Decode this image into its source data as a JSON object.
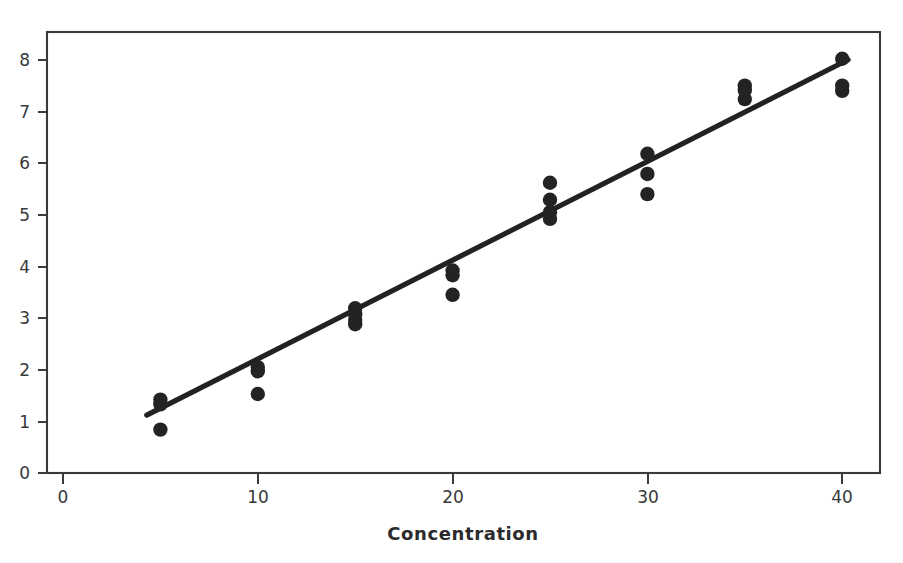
{
  "chart_data": {
    "type": "scatter",
    "title": "",
    "subtitle": "",
    "xlabel": "Concentration",
    "ylabel": "",
    "xlim": [
      0,
      42
    ],
    "ylim": [
      0,
      8.4
    ],
    "xticks": [
      0,
      10,
      20,
      30,
      40
    ],
    "yticks": [
      0,
      1,
      2,
      3,
      4,
      5,
      6,
      7,
      8
    ],
    "xticklabels": [
      "0",
      "10",
      "20",
      "30",
      "40"
    ],
    "yticklabels": [
      "0",
      "1",
      "2",
      "3",
      "4",
      "5",
      "6",
      "7",
      "8"
    ],
    "grid": false,
    "legend": null,
    "legend_position": "none",
    "marker": "filled-circle",
    "marker_color": "#232325",
    "series": [
      {
        "name": "Observations",
        "type": "scatter",
        "points": [
          {
            "x": 5,
            "y": 1.42
          },
          {
            "x": 5,
            "y": 1.33
          },
          {
            "x": 5,
            "y": 0.84
          },
          {
            "x": 10,
            "y": 2.05
          },
          {
            "x": 10,
            "y": 1.97
          },
          {
            "x": 10,
            "y": 1.53
          },
          {
            "x": 15,
            "y": 3.19
          },
          {
            "x": 15,
            "y": 3.07
          },
          {
            "x": 15,
            "y": 2.96
          },
          {
            "x": 15,
            "y": 2.88
          },
          {
            "x": 20,
            "y": 3.92
          },
          {
            "x": 20,
            "y": 3.83
          },
          {
            "x": 20,
            "y": 3.45
          },
          {
            "x": 25,
            "y": 5.62
          },
          {
            "x": 25,
            "y": 5.29
          },
          {
            "x": 25,
            "y": 5.05
          },
          {
            "x": 25,
            "y": 4.92
          },
          {
            "x": 30,
            "y": 6.18
          },
          {
            "x": 30,
            "y": 5.79
          },
          {
            "x": 30,
            "y": 5.4
          },
          {
            "x": 35,
            "y": 7.5
          },
          {
            "x": 35,
            "y": 7.41
          },
          {
            "x": 35,
            "y": 7.24
          },
          {
            "x": 40,
            "y": 8.02
          },
          {
            "x": 40,
            "y": 7.5
          },
          {
            "x": 40,
            "y": 7.4
          }
        ]
      },
      {
        "name": "Fitted regression line",
        "type": "line",
        "color": "#222224",
        "x_start": 4.3,
        "y_start": 1.12,
        "x_end": 40.3,
        "y_end": 8.0
      }
    ]
  },
  "axes": {
    "x_axis_label": "Concentration",
    "y_axis_label": ""
  }
}
